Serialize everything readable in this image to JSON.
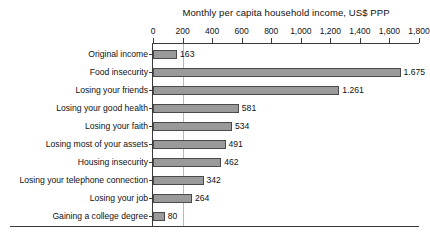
{
  "chart_data": {
    "type": "bar",
    "orientation": "horizontal",
    "title": "Monthly per capita household income, US$ PPP",
    "xlabel": "",
    "ylabel": "",
    "xlim": [
      0,
      1800
    ],
    "xtick_step": 200,
    "xticks": [
      "0",
      "200",
      "400",
      "600",
      "800",
      "1,000",
      "1,200",
      "1,400",
      "1,600",
      "1,800"
    ],
    "xtick_values": [
      0,
      200,
      400,
      600,
      800,
      1000,
      1200,
      1400,
      1600,
      1800
    ],
    "grid": "single vertical gridline at 200",
    "gridline_values": [
      200
    ],
    "legend": "none",
    "categories": [
      "Original income",
      "Food insecurity",
      "Losing your friends",
      "Losing your good health",
      "Losing your faith",
      "Losing most of your assets",
      "Housing insecurity",
      "Losing your telephone connection",
      "Losing your job",
      "Gaining a college degree"
    ],
    "values": [
      163,
      1675,
      1261,
      581,
      534,
      491,
      462,
      342,
      264,
      80
    ],
    "value_labels": [
      "163",
      "1.675",
      "1.261",
      "581",
      "534",
      "491",
      "462",
      "342",
      "264",
      "80"
    ],
    "colors": {
      "bar_fill": "#9a9a9a",
      "bar_outline": "#4a4a4a",
      "axis": "#3a3a3a",
      "gridline": "#b9b9b9",
      "text": "#111111",
      "background": "#ffffff"
    }
  }
}
